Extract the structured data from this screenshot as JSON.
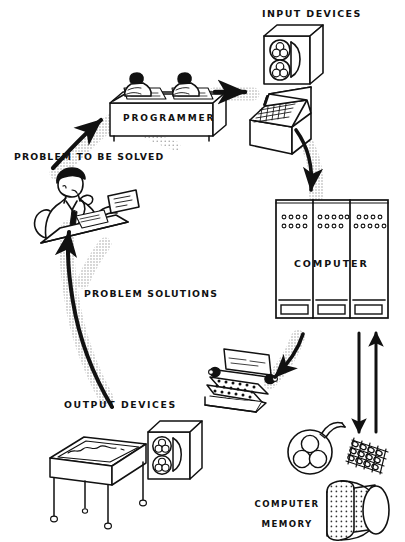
{
  "diagram": {
    "background_color": "#ffffff",
    "ink_color": "#111111",
    "shadow_color": "#9a9a9a",
    "labels": {
      "input_devices": "INPUT DEVICES",
      "programmer": "PROGRAMMER",
      "problem_to_be_solved": "PROBLEM TO BE SOLVED",
      "problem_solutions": "PROBLEM SOLUTIONS",
      "computer": "COMPUTER",
      "output_devices": "OUTPUT DEVICES",
      "computer_memory_line1": "COMPUTER",
      "computer_memory_line2": "MEMORY"
    },
    "nodes": [
      {
        "id": "problem",
        "label": "PROBLEM TO BE SOLVED",
        "icon": "man-at-desk-thinking-icon"
      },
      {
        "id": "programmer",
        "label": "PROGRAMMER",
        "icon": "two-programmers-at-desk-icon"
      },
      {
        "id": "input",
        "label": "INPUT DEVICES",
        "icon": "tape-drive-icon"
      },
      {
        "id": "console",
        "label": "",
        "icon": "keypunch-console-icon"
      },
      {
        "id": "computer",
        "label": "COMPUTER",
        "icon": "mainframe-cabinets-icon"
      },
      {
        "id": "printer",
        "label": "",
        "icon": "teleprinter-icon"
      },
      {
        "id": "output",
        "label": "OUTPUT DEVICES",
        "icon": "plotter-table-icon"
      },
      {
        "id": "output_tape",
        "label": "",
        "icon": "tape-drive-icon"
      },
      {
        "id": "memory_reel",
        "label": "",
        "icon": "tape-reel-icon"
      },
      {
        "id": "memory_core",
        "label": "",
        "icon": "core-memory-grid-icon"
      },
      {
        "id": "memory_drum",
        "label": "COMPUTER MEMORY",
        "icon": "magnetic-drum-icon"
      }
    ],
    "arrows": [
      {
        "id": "a1",
        "from": "problem",
        "to": "programmer",
        "style": "solid-with-halftone-shadow",
        "direction": "up-right"
      },
      {
        "id": "a2",
        "from": "programmer",
        "to": "input",
        "style": "solid-with-halftone-shadow",
        "direction": "right"
      },
      {
        "id": "a3",
        "from": "console",
        "to": "computer",
        "style": "curved-with-halftone-shadow",
        "direction": "down"
      },
      {
        "id": "a4",
        "from": "computer",
        "to": "printer",
        "style": "curved-with-halftone-shadow",
        "direction": "down-left"
      },
      {
        "id": "a5",
        "from": "output",
        "to": "problem",
        "style": "curved-with-halftone-shadow",
        "direction": "up-left"
      },
      {
        "id": "a6",
        "from": "computer",
        "to": "memory",
        "style": "solid-straight",
        "direction": "down"
      },
      {
        "id": "a7",
        "from": "memory",
        "to": "computer",
        "style": "solid-straight",
        "direction": "up"
      }
    ],
    "mainframe": {
      "cabinet_count": 3,
      "lights_per_cabinet": [
        {
          "row1": 4,
          "row2": 4
        },
        {
          "row1": 5,
          "row2": 4
        },
        {
          "row1": 4,
          "row2": 5
        }
      ]
    }
  }
}
